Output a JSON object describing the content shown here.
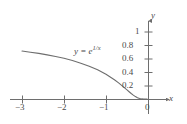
{
  "figure": {
    "name": "exponential-decay-graph",
    "background_color": "#ffffff",
    "ink_color": "#6e6e6e",
    "text_color": "#4a4a4a"
  },
  "axes": {
    "x_axis_name": "x",
    "y_axis_name": "y",
    "x_ticks": [
      {
        "label": "−3",
        "value": -3
      },
      {
        "label": "−2",
        "value": -2
      },
      {
        "label": "−1",
        "value": -1
      }
    ],
    "origin_label": "0",
    "y_ticks": [
      {
        "label": "0.2",
        "value": 0.2
      },
      {
        "label": "0.4",
        "value": 0.4
      },
      {
        "label": "0.6",
        "value": 0.6
      },
      {
        "label": "0.8",
        "value": 0.8
      },
      {
        "label": "1",
        "value": 1
      }
    ]
  },
  "curve_label": {
    "lhs": "y",
    "equals": "=",
    "base": "e",
    "exponent_numerator": "1",
    "exponent_slash": "/",
    "exponent_denominator": "x"
  },
  "chart_data": {
    "type": "line",
    "title": "",
    "subtitle": "",
    "xlabel": "x",
    "ylabel": "y",
    "xlim": [
      -3.35,
      0.55
    ],
    "ylim": [
      -0.08,
      1.22
    ],
    "grid": false,
    "legend": null,
    "annotations": [
      {
        "text": "y = e^(1/x)",
        "x": -1.1,
        "y": 0.72
      }
    ],
    "xticks": [
      -3,
      -2,
      -1,
      0
    ],
    "xticklabels": [
      "−3",
      "−2",
      "−1",
      "0"
    ],
    "yticks": [
      0.2,
      0.4,
      0.6,
      0.8,
      1
    ],
    "yticklabels": [
      "0.2",
      "0.4",
      "0.6",
      "0.8",
      "1"
    ],
    "series": [
      {
        "name": "y = e^(1/x)",
        "color": "#6e6e6e",
        "x": [
          -3.0,
          -2.8,
          -2.6,
          -2.4,
          -2.2,
          -2.0,
          -1.8,
          -1.6,
          -1.4,
          -1.2,
          -1.0,
          -0.9,
          -0.8,
          -0.7,
          -0.6,
          -0.5,
          -0.45,
          -0.4,
          -0.35,
          -0.3,
          -0.25,
          -0.2,
          -0.15,
          -0.1,
          -0.05,
          -0.02
        ],
        "y": [
          0.717,
          0.699,
          0.681,
          0.659,
          0.634,
          0.607,
          0.574,
          0.535,
          0.49,
          0.435,
          0.368,
          0.329,
          0.287,
          0.24,
          0.189,
          0.135,
          0.108,
          0.082,
          0.058,
          0.036,
          0.018,
          0.0067,
          0.0012,
          4.5e-05,
          0.0,
          0.0
        ]
      }
    ]
  }
}
